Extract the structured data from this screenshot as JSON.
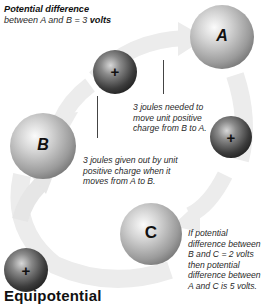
{
  "title": {
    "line1": "Potential difference",
    "line2_prefix": "between A and B = 3 ",
    "line2_bold": "volts"
  },
  "spheres": {
    "a": {
      "label": "A"
    },
    "b": {
      "label": "B"
    },
    "c": {
      "label": "C"
    }
  },
  "charges": [
    {
      "symbol": "+"
    },
    {
      "symbol": "+"
    },
    {
      "symbol": "+"
    }
  ],
  "notes": {
    "b_to_a": [
      "3 joules needed to",
      "move unit positive",
      "charge from B to A."
    ],
    "a_to_b": [
      "3 joules given out by unit",
      "positive charge when it",
      "moves from A to B."
    ],
    "c_note": [
      "If potential",
      "difference between",
      "B and C = 2 volts",
      "then potential",
      "difference between",
      "A and C is 5 volts."
    ]
  },
  "heading": "Equipotential",
  "colors": {
    "arrow": "#ececec",
    "text": "#2a2a2a"
  }
}
